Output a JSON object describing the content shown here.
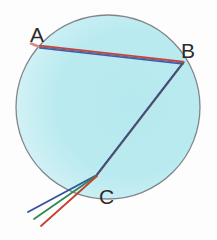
{
  "figure": {
    "background_color": "#fdfdfd"
  },
  "droplet": {
    "name": "water-droplet",
    "center_x": 108,
    "center_y": 107,
    "radius": 92,
    "fill_color": "#b8eaef",
    "fill_color_edge": "#eaf8fa",
    "outline_color": "#6e7275",
    "outline_width": 1.3
  },
  "labels": {
    "a": "A",
    "b": "B",
    "c": "C",
    "a_x": 30,
    "a_y": 42,
    "b_x": 181,
    "b_y": 58,
    "c_x": 99,
    "c_y": 204,
    "color": "#2b2b2b",
    "font_size": 21
  },
  "points": {
    "entry": {
      "name": "A",
      "x": 40,
      "y": 47
    },
    "reflection": {
      "name": "B",
      "x": 183,
      "y": 63
    },
    "exit": {
      "name": "C",
      "x": 96,
      "y": 176
    }
  },
  "rays": {
    "incident": {
      "name": "incident-ray",
      "from_x": 33,
      "from_y": 44,
      "to_x": 40,
      "to_y": 47,
      "color": "#d88a86",
      "width": 2.4
    },
    "segment_ab": {
      "name": "ray-segment-a-to-b",
      "from_x": 40,
      "from_y": 47,
      "to_x": 183,
      "to_y": 63,
      "components": [
        {
          "color": "#c8453a",
          "offset": -1.2,
          "width": 1.6
        },
        {
          "color": "#2f8f4e",
          "offset": 0.0,
          "width": 1.2
        },
        {
          "color": "#3b5fae",
          "offset": 1.2,
          "width": 1.6
        }
      ]
    },
    "segment_bc": {
      "name": "ray-segment-b-to-c",
      "from_x": 183,
      "from_y": 63,
      "to_x": 96,
      "to_y": 176,
      "components": [
        {
          "color": "#9c4a3c",
          "offset": -1.1,
          "width": 1.5
        },
        {
          "color": "#3f7d4e",
          "offset": 0.1,
          "width": 1.3
        },
        {
          "color": "#3a4e8c",
          "offset": 1.2,
          "width": 1.5
        }
      ]
    },
    "emergent": {
      "name": "emergent-dispersed-rays",
      "origin_x": 96,
      "origin_y": 176,
      "spectrum": [
        {
          "name": "blue-ray",
          "color": "#3b4fa0",
          "end_x": 28,
          "end_y": 212
        },
        {
          "name": "green-ray",
          "color": "#2e8b4f",
          "end_x": 34,
          "end_y": 219
        },
        {
          "name": "red-ray",
          "color": "#c4402f",
          "end_x": 41,
          "end_y": 226
        }
      ],
      "width": 1.8
    }
  }
}
